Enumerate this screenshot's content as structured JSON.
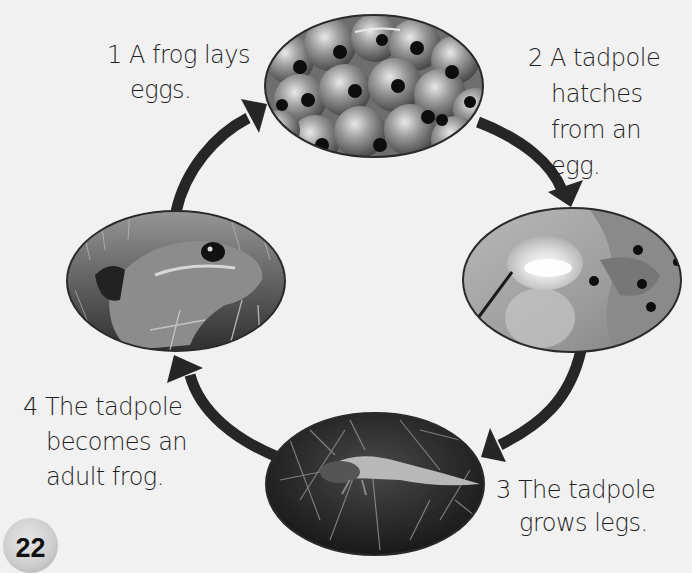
{
  "diagram": {
    "type": "life-cycle",
    "subject": "frog",
    "colors": {
      "background": "#f1f1f1",
      "arrow": "#262626",
      "text": "#1f1f1f",
      "photo_border": "#2a2a2a"
    },
    "stages": [
      {
        "number": "1",
        "lines": [
          "1 A frog lays",
          "eggs."
        ],
        "photo": "frog-spawn-eggs"
      },
      {
        "number": "2",
        "lines": [
          "2 A tadpole",
          "hatches",
          "from an",
          "egg."
        ],
        "photo": "tadpole-hatching"
      },
      {
        "number": "3",
        "lines": [
          "3 The tadpole",
          "grows legs."
        ],
        "photo": "tadpole-with-legs"
      },
      {
        "number": "4",
        "lines": [
          "4 The tadpole",
          "becomes an",
          "adult frog."
        ],
        "photo": "adult-frog"
      }
    ],
    "arrows": [
      {
        "from": "1",
        "to": "2"
      },
      {
        "from": "2",
        "to": "3"
      },
      {
        "from": "3",
        "to": "4"
      },
      {
        "from": "4",
        "to": "1"
      }
    ]
  },
  "page": {
    "number": "22"
  }
}
